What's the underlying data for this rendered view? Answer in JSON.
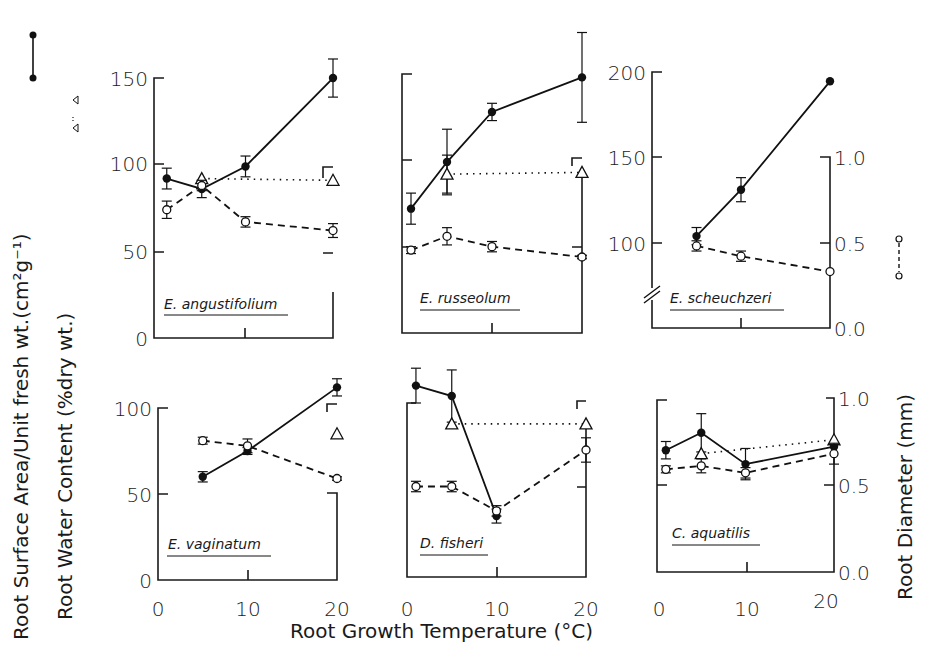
{
  "figure": {
    "y_title_left_1": "Root Surface Area/Unit fresh wt.(cm²g⁻¹)",
    "y_title_left_2": "Root Water Content (%dry wt.)",
    "y_title_right": "Root Diameter  (mm)",
    "x_title": "Root Growth Temperature  (°C)"
  },
  "chart_data": {
    "type": "line",
    "title": "",
    "xlabel": "Root Growth Temperature (°C)",
    "ylabel_left": "Root Surface Area/Unit fresh wt. (cm2 g-1); Root Water Content (% dry wt.)",
    "ylabel_right": "Root Diameter (mm)",
    "legend": [
      {
        "name": "Root Surface Area/Unit fresh wt.",
        "style": "solid line, filled circles"
      },
      {
        "name": "Root Water Content (% dry wt.)",
        "style": "dotted line, open triangles"
      },
      {
        "name": "Root Diameter (mm)",
        "style": "dashed line, open circles"
      }
    ],
    "panels": [
      {
        "species": "E. angustifolium",
        "row": 0,
        "col": 0,
        "xlim": [
          0,
          20
        ],
        "xticks": [
          0,
          10,
          20
        ],
        "ylim_left": [
          0,
          150
        ],
        "yticks_left": [
          0,
          50,
          100,
          150
        ],
        "ylim_right": [
          0.0,
          1.5
        ],
        "yticks_right": [],
        "series": [
          {
            "name": "Surface Area",
            "x": [
              1,
              5,
              10,
              20
            ],
            "values": [
              92,
              86,
              99,
              150
            ],
            "err": [
              6,
              5,
              6,
              11
            ]
          },
          {
            "name": "Water Content",
            "x": [
              5,
              20
            ],
            "values": [
              92,
              91
            ],
            "err": [
              0,
              0
            ]
          },
          {
            "name": "Root Diameter",
            "x": [
              1,
              5,
              10,
              20
            ],
            "values": [
              0.74,
              0.88,
              0.67,
              0.62
            ],
            "err": [
              0.05,
              0.03,
              0.03,
              0.04
            ]
          }
        ]
      },
      {
        "species": "E. russeolum",
        "row": 0,
        "col": 1,
        "xlim": [
          0,
          20
        ],
        "xticks": [
          0,
          10,
          20
        ],
        "ylim_left": [
          0,
          150
        ],
        "yticks_left": [
          0,
          50,
          100,
          150
        ],
        "ylim_right": [
          0.0,
          1.5
        ],
        "yticks_right": [],
        "series": [
          {
            "name": "Surface Area",
            "x": [
              1,
              5,
              10,
              20
            ],
            "values": [
              72,
              99,
              128,
              148
            ],
            "err": [
              9,
              19,
              5,
              26
            ]
          },
          {
            "name": "Water Content",
            "x": [
              5,
              20
            ],
            "values": [
              92,
              93
            ],
            "err": [
              11,
              0
            ]
          },
          {
            "name": "Root Diameter",
            "x": [
              1,
              5,
              10,
              20
            ],
            "values": [
              0.48,
              0.56,
              0.5,
              0.44
            ],
            "err": [
              0.02,
              0.05,
              0.03,
              0.01
            ]
          }
        ]
      },
      {
        "species": "E. scheuchzeri",
        "row": 0,
        "col": 2,
        "xlim": [
          0,
          20
        ],
        "xticks": [
          0,
          10,
          20
        ],
        "ylim_left": [
          50,
          200
        ],
        "yticks_left": [
          100,
          150,
          200
        ],
        "axis_break": true,
        "ylim_right": [
          0.0,
          1.0
        ],
        "yticks_right": [
          0.0,
          0.5,
          1.0
        ],
        "series": [
          {
            "name": "Surface Area",
            "x": [
              5,
              10,
              20
            ],
            "values": [
              104,
              131,
              194
            ],
            "err": [
              5,
              7,
              0
            ]
          },
          {
            "name": "Root Diameter",
            "x": [
              5,
              10,
              20
            ],
            "values": [
              0.48,
              0.42,
              0.33
            ],
            "err": [
              0.03,
              0.03,
              0
            ]
          }
        ]
      },
      {
        "species": "E. vaginatum",
        "row": 1,
        "col": 0,
        "xlim": [
          0,
          20
        ],
        "xticks": [
          0,
          10,
          20
        ],
        "ylim_left": [
          0,
          100
        ],
        "yticks_left": [
          0,
          50,
          100
        ],
        "ylim_right": [
          0.0,
          1.0
        ],
        "yticks_right": [],
        "series": [
          {
            "name": "Surface Area",
            "x": [
              5,
              10,
              20
            ],
            "values": [
              60,
              75,
              112
            ],
            "err": [
              3,
              2,
              5
            ]
          },
          {
            "name": "Water Content",
            "x": [
              20
            ],
            "values": [
              85
            ],
            "err": [
              0
            ]
          },
          {
            "name": "Root Diameter",
            "x": [
              5,
              10,
              20
            ],
            "values": [
              0.81,
              0.78,
              0.59
            ],
            "err": [
              0.02,
              0.04,
              0.01
            ]
          }
        ]
      },
      {
        "species": "D. fisheri",
        "row": 1,
        "col": 1,
        "xlim": [
          0,
          20
        ],
        "xticks": [
          0,
          10,
          20
        ],
        "ylim_left": [
          0,
          100
        ],
        "yticks_left": [],
        "ylim_right": [
          0.0,
          1.0
        ],
        "yticks_right": [],
        "series": [
          {
            "name": "Surface Area",
            "x": [
              1,
              5,
              10
            ],
            "values": [
              110,
              104,
              35
            ],
            "err": [
              10,
              15,
              4
            ]
          },
          {
            "name": "Water Content",
            "x": [
              5,
              20
            ],
            "values": [
              88,
              88
            ],
            "err": [
              0,
              0
            ]
          },
          {
            "name": "Root Diameter",
            "x": [
              1,
              5,
              10,
              20
            ],
            "values": [
              0.52,
              0.52,
              0.38,
              0.73
            ],
            "err": [
              0.03,
              0.03,
              0.03,
              0.07
            ]
          }
        ]
      },
      {
        "species": "C. aquatilis",
        "row": 1,
        "col": 2,
        "xlim": [
          0,
          20
        ],
        "xticks": [
          0,
          10,
          20
        ],
        "ylim_left": [
          0,
          100
        ],
        "yticks_left": [],
        "ylim_right": [
          0.0,
          1.0
        ],
        "yticks_right": [
          0.0,
          0.5,
          1.0
        ],
        "series": [
          {
            "name": "Surface Area",
            "x": [
              1,
              5,
              10,
              20
            ],
            "values": [
              70,
              80,
              62,
              72
            ],
            "err": [
              5,
              11,
              9,
              0
            ]
          },
          {
            "name": "Water Content",
            "x": [
              5,
              20
            ],
            "values": [
              68,
              76
            ],
            "err": [
              0,
              0
            ]
          },
          {
            "name": "Root Diameter",
            "x": [
              1,
              5,
              10,
              20
            ],
            "values": [
              0.59,
              0.61,
              0.57,
              0.68
            ],
            "err": [
              0.02,
              0.04,
              0.03,
              0.06
            ]
          }
        ]
      }
    ]
  },
  "tick_labels": {
    "p1_y": [
      "150",
      "100",
      "50",
      "0"
    ],
    "p3_y": [
      "200",
      "150",
      "100"
    ],
    "p3_r": [
      "1.0",
      "0.5",
      "0.0"
    ],
    "p4_y": [
      "100",
      "50",
      "0"
    ],
    "p6_r": [
      "1.0",
      "0.5",
      "0.0"
    ],
    "x": [
      "0",
      "10",
      "20"
    ]
  }
}
